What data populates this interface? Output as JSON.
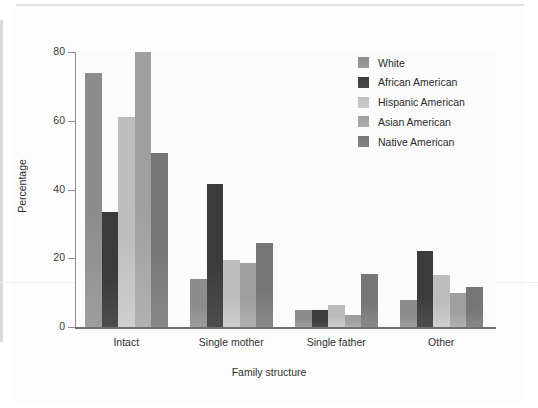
{
  "chart_data": {
    "type": "bar",
    "title": "",
    "xlabel": "Family structure",
    "ylabel": "Percentage",
    "categories": [
      "Intact",
      "Single mother",
      "Single father",
      "Other"
    ],
    "ylim": [
      0,
      80
    ],
    "yticks": [
      0,
      20,
      40,
      60,
      80
    ],
    "grid": false,
    "legend_position": "top-right",
    "series": [
      {
        "name": "White",
        "color": "#8c8c8c",
        "values": [
          74.0,
          14.0,
          5.0,
          8.0
        ]
      },
      {
        "name": "African American",
        "color": "#3b3b3b",
        "values": [
          33.5,
          41.5,
          5.0,
          22.0
        ]
      },
      {
        "name": "Hispanic American",
        "color": "#bdbdbd",
        "values": [
          61.0,
          19.5,
          6.5,
          15.0
        ]
      },
      {
        "name": "Asian American",
        "color": "#9f9f9f",
        "values": [
          80.0,
          18.5,
          3.5,
          10.0
        ]
      },
      {
        "name": "Native American",
        "color": "#767676",
        "values": [
          50.5,
          24.5,
          15.5,
          11.5
        ]
      }
    ]
  },
  "axis": {
    "tick_labels_y": [
      "80",
      "60",
      "40",
      "20",
      "0"
    ],
    "ylabel_text": "Percentage",
    "xlabel_text": "Family structure"
  }
}
